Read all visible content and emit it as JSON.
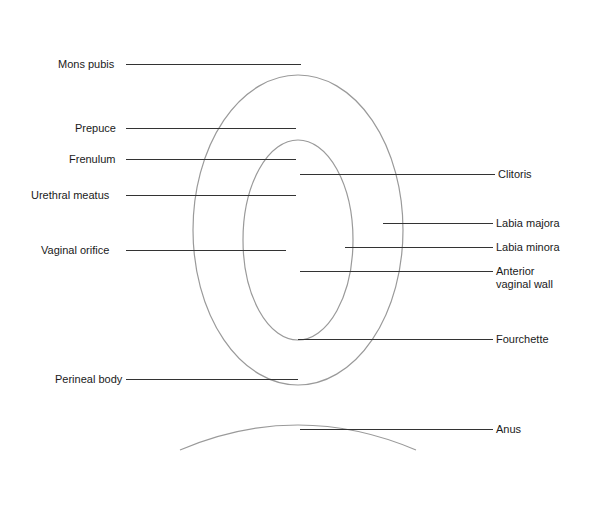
{
  "figure": {
    "type": "anatomical illustration (abstracted)",
    "labels_left": [
      {
        "text": "Mons pubis",
        "y": 64
      },
      {
        "text": "Prepuce",
        "y": 128
      },
      {
        "text": "Frenulum",
        "y": 159
      },
      {
        "text": "Urethral meatus",
        "y": 195
      },
      {
        "text": "Vaginal orifice",
        "y": 250
      },
      {
        "text": "Perineal body",
        "y": 379
      }
    ],
    "labels_right": [
      {
        "text": "Clitoris",
        "y": 174
      },
      {
        "text": "Labia majora",
        "y": 223
      },
      {
        "text": "Labia minora",
        "y": 247
      },
      {
        "text": "Anterior",
        "y": 271
      },
      {
        "text": "vaginal wall",
        "y": 285
      },
      {
        "text": "Fourchette",
        "y": 339
      },
      {
        "text": "Anus",
        "y": 429
      }
    ]
  }
}
